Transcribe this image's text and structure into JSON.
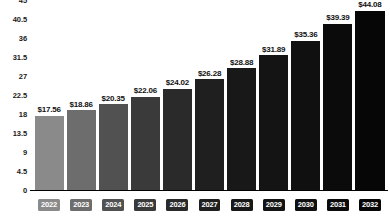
{
  "chart_data": {
    "type": "bar",
    "title": "",
    "subtitle": "",
    "xlabel": "",
    "ylabel": "",
    "grid": false,
    "legend": false,
    "ylim": [
      0,
      45
    ],
    "yticks": [
      "0",
      "4.5",
      "9",
      "13.5",
      "18",
      "22.5",
      "27",
      "31.5",
      "36",
      "40.5",
      "45"
    ],
    "ytick_values": [
      0,
      4.5,
      9,
      13.5,
      18,
      22.5,
      27,
      31.5,
      36,
      40.5,
      45
    ],
    "categories": [
      "2022",
      "2023",
      "2024",
      "2025",
      "2026",
      "2027",
      "2028",
      "2029",
      "2030",
      "2031",
      "2032"
    ],
    "values": [
      17.56,
      18.86,
      20.35,
      22.06,
      24.02,
      26.28,
      28.88,
      31.89,
      35.36,
      39.39,
      44.08
    ],
    "data_labels": [
      "$17.56",
      "$18.86",
      "$20.35",
      "$22.06",
      "$24.02",
      "$26.28",
      "$28.88",
      "$31.89",
      "$35.36",
      "$39.39",
      "$44.08"
    ],
    "bar_colors": [
      "#8a8a8a",
      "#6d6d6d",
      "#515151",
      "#3a3a3a",
      "#2a2a2a",
      "#1f1f1f",
      "#181818",
      "#141414",
      "#101010",
      "#0b0b0b",
      "#060606"
    ]
  }
}
